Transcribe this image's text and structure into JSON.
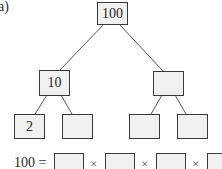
{
  "part_label": "a)",
  "tree": {
    "root": {
      "value": "100"
    },
    "level1": [
      {
        "value": "10"
      },
      {
        "value": ""
      }
    ],
    "level2": [
      {
        "value": "2"
      },
      {
        "value": ""
      },
      {
        "value": ""
      },
      {
        "value": ""
      }
    ]
  },
  "equation": {
    "lhs": "100 =",
    "operator": "×",
    "blanks": [
      "",
      "",
      "",
      ""
    ]
  },
  "colors": {
    "box_fill": "#f0f0f0",
    "box_border": "#3a3a3a",
    "line": "#555555"
  }
}
